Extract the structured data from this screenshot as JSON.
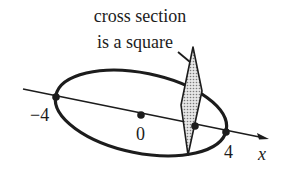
{
  "caption": {
    "line1": "cross section",
    "line2": "is a square"
  },
  "axis": {
    "label": "x",
    "ticks": [
      {
        "label": "−4",
        "value": -4
      },
      {
        "label": "0",
        "value": 0
      },
      {
        "label": "4",
        "value": 4
      }
    ]
  },
  "shapes": {
    "base": "ellipse",
    "cross_section": "square (shaded, seen in perspective)"
  },
  "colors": {
    "ink": "#1c1c1c",
    "shade": "#bdbdbd",
    "background": "#ffffff"
  }
}
